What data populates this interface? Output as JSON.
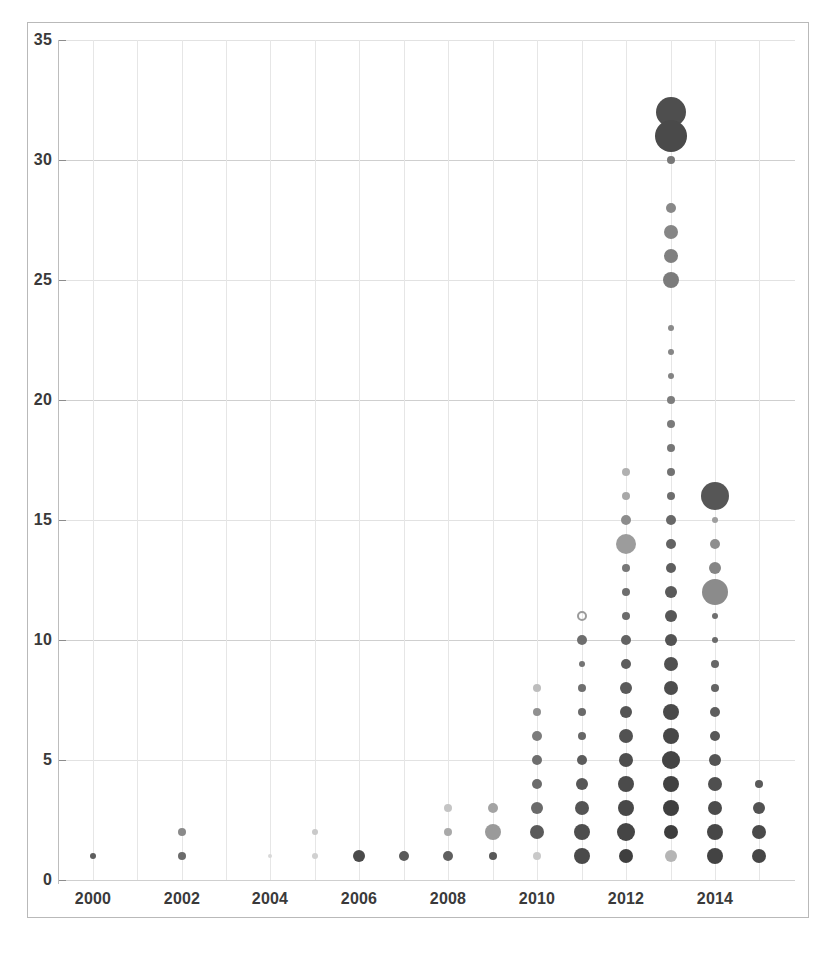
{
  "chart_data": {
    "type": "scatter",
    "title": "",
    "subtitle": "",
    "xlabel": "",
    "ylabel": "",
    "xlim": [
      1999.4,
      2015.8
    ],
    "ylim": [
      0,
      35
    ],
    "grid": true,
    "legend_position": "none",
    "x_ticks": [
      "2000",
      "2002",
      "2004",
      "2006",
      "2008",
      "2010",
      "2012",
      "2014"
    ],
    "x_tick_values": [
      2000,
      2002,
      2004,
      2006,
      2008,
      2010,
      2012,
      2014
    ],
    "y_ticks": [
      "0",
      "5",
      "10",
      "15",
      "20",
      "25",
      "30",
      "35"
    ],
    "y_tick_values": [
      0,
      5,
      10,
      15,
      20,
      25,
      30,
      35
    ],
    "size_encoding": "bubble radius encodes magnitude",
    "color_encoding": "gray shade, darker = higher value",
    "points": [
      {
        "x": 2000,
        "y": 1,
        "r": 3,
        "color": "#5e5e5e"
      },
      {
        "x": 2002,
        "y": 2,
        "r": 4,
        "color": "#8a8a8a"
      },
      {
        "x": 2002,
        "y": 1,
        "r": 4,
        "color": "#6b6b6b"
      },
      {
        "x": 2004,
        "y": 1,
        "r": 2,
        "color": "#d8d8d8"
      },
      {
        "x": 2005,
        "y": 2,
        "r": 3,
        "color": "#c9c9c9"
      },
      {
        "x": 2005,
        "y": 1,
        "r": 3,
        "color": "#d0d0d0"
      },
      {
        "x": 2006,
        "y": 1,
        "r": 6,
        "color": "#4a4a4a"
      },
      {
        "x": 2007,
        "y": 1,
        "r": 5,
        "color": "#5a5a5a"
      },
      {
        "x": 2008,
        "y": 3,
        "r": 4,
        "color": "#c4c4c4"
      },
      {
        "x": 2008,
        "y": 2,
        "r": 4,
        "color": "#a9a9a9"
      },
      {
        "x": 2008,
        "y": 1,
        "r": 5,
        "color": "#5f5f5f"
      },
      {
        "x": 2009,
        "y": 3,
        "r": 5,
        "color": "#a3a3a3"
      },
      {
        "x": 2009,
        "y": 2,
        "r": 8,
        "color": "#9a9a9a"
      },
      {
        "x": 2009,
        "y": 1,
        "r": 4,
        "color": "#585858"
      },
      {
        "x": 2010,
        "y": 8,
        "r": 4,
        "color": "#bdbdbd"
      },
      {
        "x": 2010,
        "y": 7,
        "r": 4,
        "color": "#909090"
      },
      {
        "x": 2010,
        "y": 6,
        "r": 5,
        "color": "#7c7c7c"
      },
      {
        "x": 2010,
        "y": 5,
        "r": 5,
        "color": "#6e6e6e"
      },
      {
        "x": 2010,
        "y": 4,
        "r": 5,
        "color": "#6b6b6b"
      },
      {
        "x": 2010,
        "y": 3,
        "r": 6,
        "color": "#6a6a6a"
      },
      {
        "x": 2010,
        "y": 2,
        "r": 7,
        "color": "#5a5a5a"
      },
      {
        "x": 2010,
        "y": 1,
        "r": 4,
        "color": "#c9c9c9"
      },
      {
        "x": 2011,
        "y": 11,
        "r": 5,
        "color": "#9b9b9b",
        "style": "ring"
      },
      {
        "x": 2011,
        "y": 10,
        "r": 5,
        "color": "#6e6e6e"
      },
      {
        "x": 2011,
        "y": 9,
        "r": 3,
        "color": "#747474"
      },
      {
        "x": 2011,
        "y": 8,
        "r": 4,
        "color": "#6f6f6f"
      },
      {
        "x": 2011,
        "y": 7,
        "r": 4,
        "color": "#6a6a6a"
      },
      {
        "x": 2011,
        "y": 6,
        "r": 4,
        "color": "#666666"
      },
      {
        "x": 2011,
        "y": 5,
        "r": 5,
        "color": "#5c5c5c"
      },
      {
        "x": 2011,
        "y": 4,
        "r": 6,
        "color": "#575757"
      },
      {
        "x": 2011,
        "y": 3,
        "r": 7,
        "color": "#545454"
      },
      {
        "x": 2011,
        "y": 2,
        "r": 8,
        "color": "#4e4e4e"
      },
      {
        "x": 2011,
        "y": 1,
        "r": 8,
        "color": "#4a4a4a"
      },
      {
        "x": 2012,
        "y": 17,
        "r": 4,
        "color": "#b0b0b0"
      },
      {
        "x": 2012,
        "y": 16,
        "r": 4,
        "color": "#a8a8a8"
      },
      {
        "x": 2012,
        "y": 15,
        "r": 5,
        "color": "#8d8d8d"
      },
      {
        "x": 2012,
        "y": 14,
        "r": 10,
        "color": "#9c9c9c"
      },
      {
        "x": 2012,
        "y": 13,
        "r": 4,
        "color": "#777777"
      },
      {
        "x": 2012,
        "y": 12,
        "r": 4,
        "color": "#6e6e6e"
      },
      {
        "x": 2012,
        "y": 11,
        "r": 4,
        "color": "#6c6c6c"
      },
      {
        "x": 2012,
        "y": 10,
        "r": 5,
        "color": "#636363"
      },
      {
        "x": 2012,
        "y": 9,
        "r": 5,
        "color": "#5d5d5d"
      },
      {
        "x": 2012,
        "y": 8,
        "r": 6,
        "color": "#5a5a5a"
      },
      {
        "x": 2012,
        "y": 7,
        "r": 6,
        "color": "#555555"
      },
      {
        "x": 2012,
        "y": 6,
        "r": 7,
        "color": "#525252"
      },
      {
        "x": 2012,
        "y": 5,
        "r": 7,
        "color": "#4e4e4e"
      },
      {
        "x": 2012,
        "y": 4,
        "r": 8,
        "color": "#4b4b4b"
      },
      {
        "x": 2012,
        "y": 3,
        "r": 8,
        "color": "#484848"
      },
      {
        "x": 2012,
        "y": 2,
        "r": 9,
        "color": "#454545"
      },
      {
        "x": 2012,
        "y": 1,
        "r": 7,
        "color": "#3f3f3f"
      },
      {
        "x": 2013,
        "y": 32,
        "r": 15,
        "color": "#4e4e4e"
      },
      {
        "x": 2013,
        "y": 31,
        "r": 16,
        "color": "#4a4a4a"
      },
      {
        "x": 2013,
        "y": 30,
        "r": 4,
        "color": "#777777"
      },
      {
        "x": 2013,
        "y": 28,
        "r": 5,
        "color": "#888888"
      },
      {
        "x": 2013,
        "y": 27,
        "r": 7,
        "color": "#868686"
      },
      {
        "x": 2013,
        "y": 26,
        "r": 7,
        "color": "#808080"
      },
      {
        "x": 2013,
        "y": 25,
        "r": 8,
        "color": "#7b7b7b"
      },
      {
        "x": 2013,
        "y": 23,
        "r": 3,
        "color": "#8a8a8a"
      },
      {
        "x": 2013,
        "y": 22,
        "r": 3,
        "color": "#868686"
      },
      {
        "x": 2013,
        "y": 21,
        "r": 3,
        "color": "#838383"
      },
      {
        "x": 2013,
        "y": 20,
        "r": 4,
        "color": "#7d7d7d"
      },
      {
        "x": 2013,
        "y": 19,
        "r": 4,
        "color": "#7a7a7a"
      },
      {
        "x": 2013,
        "y": 18,
        "r": 4,
        "color": "#767676"
      },
      {
        "x": 2013,
        "y": 17,
        "r": 4,
        "color": "#727272"
      },
      {
        "x": 2013,
        "y": 16,
        "r": 4,
        "color": "#6d6d6d"
      },
      {
        "x": 2013,
        "y": 15,
        "r": 5,
        "color": "#686868"
      },
      {
        "x": 2013,
        "y": 14,
        "r": 5,
        "color": "#636363"
      },
      {
        "x": 2013,
        "y": 13,
        "r": 5,
        "color": "#5e5e5e"
      },
      {
        "x": 2013,
        "y": 12,
        "r": 6,
        "color": "#5a5a5a"
      },
      {
        "x": 2013,
        "y": 11,
        "r": 6,
        "color": "#575757"
      },
      {
        "x": 2013,
        "y": 10,
        "r": 6,
        "color": "#535353"
      },
      {
        "x": 2013,
        "y": 9,
        "r": 7,
        "color": "#505050"
      },
      {
        "x": 2013,
        "y": 8,
        "r": 7,
        "color": "#4d4d4d"
      },
      {
        "x": 2013,
        "y": 7,
        "r": 8,
        "color": "#4a4a4a"
      },
      {
        "x": 2013,
        "y": 6,
        "r": 8,
        "color": "#474747"
      },
      {
        "x": 2013,
        "y": 5,
        "r": 9,
        "color": "#444444"
      },
      {
        "x": 2013,
        "y": 4,
        "r": 8,
        "color": "#424242"
      },
      {
        "x": 2013,
        "y": 3,
        "r": 8,
        "color": "#3f3f3f"
      },
      {
        "x": 2013,
        "y": 2,
        "r": 7,
        "color": "#3d3d3d"
      },
      {
        "x": 2013,
        "y": 1,
        "r": 6,
        "color": "#b5b5b5"
      },
      {
        "x": 2014,
        "y": 16,
        "r": 14,
        "color": "#565656"
      },
      {
        "x": 2014,
        "y": 15,
        "r": 3,
        "color": "#9e9e9e"
      },
      {
        "x": 2014,
        "y": 14,
        "r": 5,
        "color": "#8e8e8e"
      },
      {
        "x": 2014,
        "y": 13,
        "r": 6,
        "color": "#858585"
      },
      {
        "x": 2014,
        "y": 12,
        "r": 13,
        "color": "#8b8b8b"
      },
      {
        "x": 2014,
        "y": 11,
        "r": 3,
        "color": "#707070"
      },
      {
        "x": 2014,
        "y": 10,
        "r": 3,
        "color": "#6b6b6b"
      },
      {
        "x": 2014,
        "y": 9,
        "r": 4,
        "color": "#676767"
      },
      {
        "x": 2014,
        "y": 8,
        "r": 4,
        "color": "#646464"
      },
      {
        "x": 2014,
        "y": 7,
        "r": 5,
        "color": "#5e5e5e"
      },
      {
        "x": 2014,
        "y": 6,
        "r": 5,
        "color": "#585858"
      },
      {
        "x": 2014,
        "y": 5,
        "r": 6,
        "color": "#545454"
      },
      {
        "x": 2014,
        "y": 4,
        "r": 7,
        "color": "#4f4f4f"
      },
      {
        "x": 2014,
        "y": 3,
        "r": 7,
        "color": "#4b4b4b"
      },
      {
        "x": 2014,
        "y": 2,
        "r": 8,
        "color": "#474747"
      },
      {
        "x": 2014,
        "y": 1,
        "r": 8,
        "color": "#434343"
      },
      {
        "x": 2015,
        "y": 4,
        "r": 4,
        "color": "#5a5a5a"
      },
      {
        "x": 2015,
        "y": 3,
        "r": 6,
        "color": "#525252"
      },
      {
        "x": 2015,
        "y": 2,
        "r": 7,
        "color": "#4a4a4a"
      },
      {
        "x": 2015,
        "y": 1,
        "r": 7,
        "color": "#464646"
      }
    ]
  },
  "caption": {
    "text": ""
  }
}
